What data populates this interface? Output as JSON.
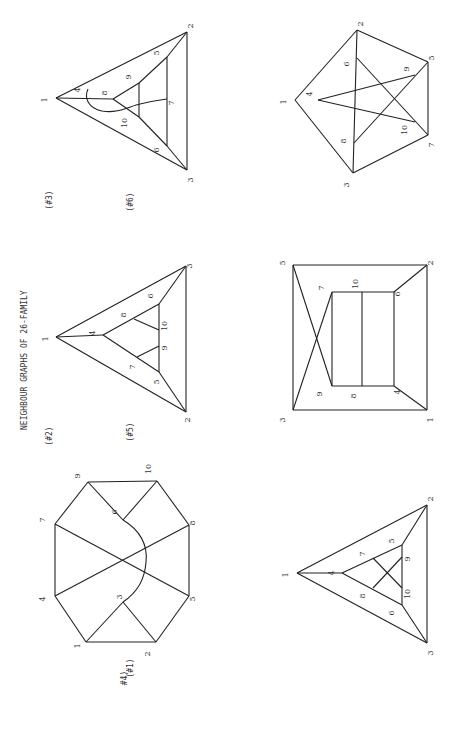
{
  "title": "NEIGHBOUR GRAPHS OF  26-FAMILY",
  "orientation": "rotated 90deg counter-clockwise (text reads bottom-to-top)",
  "graphs": [
    {
      "id": "#1",
      "caption": "(#1)",
      "caption_pos": [
        133,
        668
      ],
      "nodes": {
        "1": [
          86,
          642
        ],
        "2": [
          156,
          642
        ],
        "3": [
          123,
          602
        ],
        "4": [
          55,
          596
        ],
        "5": [
          189,
          596
        ],
        "6": [
          123,
          520
        ],
        "7": [
          55,
          524
        ],
        "8": [
          189,
          525
        ],
        "9": [
          88,
          482
        ],
        "10": [
          157,
          481
        ]
      },
      "label_offsets": {
        "1": [
          -6,
          4
        ],
        "2": [
          -6,
          12
        ],
        "3": [
          -1,
          -5
        ],
        "4": [
          -10,
          3
        ],
        "5": [
          6,
          3
        ],
        "6": [
          -6,
          -8
        ],
        "7": [
          -10,
          -4
        ],
        "8": [
          6,
          -2
        ],
        "9": [
          -8,
          -6
        ],
        "10": [
          -6,
          -12
        ]
      },
      "edges": [
        [
          "1",
          "2"
        ],
        [
          "1",
          "4"
        ],
        [
          "1",
          "3"
        ],
        [
          "2",
          "3"
        ],
        [
          "2",
          "5"
        ],
        [
          "4",
          "7"
        ],
        [
          "4",
          "8"
        ],
        [
          "7",
          "5"
        ],
        [
          "7",
          "9"
        ],
        [
          "9",
          "10"
        ],
        [
          "9",
          "6"
        ],
        [
          "6",
          "10"
        ],
        [
          "10",
          "8"
        ],
        [
          "8",
          "5"
        ]
      ],
      "curves": [
        {
          "from": "6",
          "to": "3",
          "path": "M123,520 C140,530 148,545 146,562 C145,578 138,592 123,602"
        }
      ]
    },
    {
      "id": "#2",
      "caption": "(#2)",
      "caption_pos": [
        52,
        436
      ],
      "nodes": {
        "1": [
          56,
          337
        ],
        "2": [
          186,
          412
        ],
        "3": [
          186,
          266
        ],
        "4": [
          103,
          335
        ],
        "5": [
          159,
          372
        ],
        "6": [
          159,
          304
        ],
        "7": [
          137,
          357
        ],
        "8": [
          134,
          319
        ],
        "9": [
          159,
          346
        ],
        "10": [
          159,
          330
        ]
      },
      "label_offsets": {
        "1": [
          -8,
          2
        ],
        "2": [
          4,
          8
        ],
        "3": [
          6,
          0
        ],
        "4": [
          -8,
          -2
        ],
        "5": [
          0,
          10
        ],
        "6": [
          -6,
          -8
        ],
        "7": [
          -2,
          10
        ],
        "8": [
          -8,
          -4
        ],
        "9": [
          8,
          2
        ],
        "10": [
          8,
          -4
        ]
      },
      "edges": [
        [
          "1",
          "2"
        ],
        [
          "1",
          "3"
        ],
        [
          "2",
          "3"
        ],
        [
          "1",
          "4"
        ],
        [
          "4",
          "5"
        ],
        [
          "4",
          "6"
        ],
        [
          "6",
          "3"
        ],
        [
          "5",
          "2"
        ],
        [
          "5",
          "6"
        ],
        [
          "8",
          "10"
        ],
        [
          "7",
          "9"
        ]
      ],
      "curves": []
    },
    {
      "id": "#3",
      "caption": "(#3)",
      "caption_pos": [
        52,
        200
      ],
      "nodes": {
        "1": [
          56,
          98
        ],
        "2": [
          187,
          32
        ],
        "3": [
          187,
          170
        ],
        "4": [
          82,
          98
        ],
        "5": [
          167,
          57
        ],
        "6": [
          167,
          146
        ],
        "7": [
          167,
          99
        ],
        "8": [
          113,
          99
        ],
        "9": [
          139,
          83
        ],
        "10": [
          139,
          117
        ]
      },
      "label_offsets": {
        "1": [
          -9,
          2
        ],
        "2": [
          6,
          -6
        ],
        "3": [
          6,
          10
        ],
        "4": [
          -2,
          -8
        ],
        "5": [
          -8,
          -4
        ],
        "6": [
          -8,
          4
        ],
        "7": [
          7,
          4
        ],
        "8": [
          -6,
          -6
        ],
        "9": [
          -8,
          -6
        ],
        "10": [
          -12,
          6
        ]
      },
      "edges": [
        [
          "1",
          "2"
        ],
        [
          "1",
          "3"
        ],
        [
          "2",
          "3"
        ],
        [
          "1",
          "8"
        ],
        [
          "8",
          "9"
        ],
        [
          "8",
          "10"
        ],
        [
          "9",
          "10"
        ],
        [
          "9",
          "5"
        ],
        [
          "10",
          "6"
        ],
        [
          "5",
          "6"
        ],
        [
          "5",
          "2"
        ],
        [
          "6",
          "3"
        ]
      ],
      "curves": [
        {
          "from": "4",
          "to": "7",
          "path": "M88,89 C84,98 88,108 102,111 C118,114 130,106 140,104 C152,101 160,100 167,99"
        }
      ]
    },
    {
      "id": "#4",
      "caption": "#4)",
      "caption_pos": [
        127,
        678
      ],
      "nodes": {
        "1": [
          297,
          573
        ],
        "2": [
          427,
          505
        ],
        "3": [
          427,
          643
        ],
        "4": [
          342,
          573
        ],
        "5": [
          402,
          545
        ],
        "6": [
          402,
          605
        ],
        "7": [
          373,
          558
        ],
        "8": [
          373,
          588
        ],
        "9": [
          402,
          557
        ],
        "10": [
          402,
          588
        ]
      },
      "label_offsets": {
        "1": [
          -9,
          2
        ],
        "2": [
          6,
          -6
        ],
        "3": [
          6,
          10
        ],
        "4": [
          -8,
          0
        ],
        "5": [
          -8,
          -4
        ],
        "6": [
          -8,
          8
        ],
        "7": [
          -8,
          -4
        ],
        "8": [
          -8,
          8
        ],
        "9": [
          8,
          2
        ],
        "10": [
          8,
          6
        ]
      },
      "edges": [
        [
          "1",
          "2"
        ],
        [
          "1",
          "3"
        ],
        [
          "2",
          "3"
        ],
        [
          "1",
          "4"
        ],
        [
          "4",
          "5"
        ],
        [
          "4",
          "6"
        ],
        [
          "5",
          "2"
        ],
        [
          "6",
          "3"
        ],
        [
          "5",
          "6"
        ],
        [
          "7",
          "10"
        ],
        [
          "8",
          "9"
        ]
      ],
      "curves": []
    },
    {
      "id": "#5",
      "caption": "(#5)",
      "caption_pos": [
        133,
        432
      ],
      "nodes": {
        "1": [
          427,
          410
        ],
        "2": [
          427,
          265
        ],
        "3": [
          293,
          410
        ],
        "4": [
          394,
          386
        ],
        "5": [
          293,
          265
        ],
        "6": [
          394,
          292
        ],
        "7": [
          332,
          292
        ],
        "8": [
          362,
          386
        ],
        "9": [
          332,
          386
        ],
        "10": [
          362,
          292
        ]
      },
      "label_offsets": {
        "1": [
          6,
          10
        ],
        "2": [
          6,
          -2
        ],
        "3": [
          -8,
          10
        ],
        "4": [
          6,
          6
        ],
        "5": [
          -8,
          -2
        ],
        "6": [
          6,
          2
        ],
        "7": [
          -8,
          -4
        ],
        "8": [
          -6,
          10
        ],
        "9": [
          -10,
          8
        ],
        "10": [
          -4,
          -8
        ]
      },
      "edges": [
        [
          "5",
          "2"
        ],
        [
          "2",
          "1"
        ],
        [
          "1",
          "3"
        ],
        [
          "3",
          "5"
        ],
        [
          "5",
          "9"
        ],
        [
          "3",
          "7"
        ],
        [
          "7",
          "6"
        ],
        [
          "6",
          "4"
        ],
        [
          "4",
          "9"
        ],
        [
          "9",
          "7"
        ],
        [
          "10",
          "8"
        ],
        [
          "6",
          "2"
        ],
        [
          "4",
          "1"
        ]
      ],
      "curves": []
    },
    {
      "id": "#6",
      "caption": "(#6)",
      "caption_pos": [
        133,
        202
      ],
      "nodes": {
        "1": [
          295,
          100
        ],
        "2": [
          357,
          30
        ],
        "3": [
          353,
          173
        ],
        "4": [
          318,
          100
        ],
        "5": [
          428,
          62
        ],
        "6": [
          357,
          58
        ],
        "7": [
          428,
          135
        ],
        "8": [
          354,
          143
        ],
        "9": [
          415,
          75
        ],
        "10": [
          415,
          122
        ]
      },
      "label_offsets": {
        "1": [
          -9,
          2
        ],
        "2": [
          6,
          -6
        ],
        "3": [
          -4,
          12
        ],
        "4": [
          -6,
          -6
        ],
        "5": [
          6,
          -4
        ],
        "6": [
          -8,
          6
        ],
        "7": [
          6,
          10
        ],
        "8": [
          -8,
          -2
        ],
        "9": [
          -6,
          -6
        ],
        "10": [
          -8,
          8
        ]
      },
      "edges": [
        [
          "1",
          "2"
        ],
        [
          "1",
          "3"
        ],
        [
          "2",
          "5"
        ],
        [
          "3",
          "7"
        ],
        [
          "5",
          "7"
        ],
        [
          "2",
          "3"
        ],
        [
          "4",
          "9"
        ],
        [
          "4",
          "10"
        ],
        [
          "6",
          "7"
        ],
        [
          "8",
          "5"
        ]
      ],
      "curves": []
    }
  ]
}
